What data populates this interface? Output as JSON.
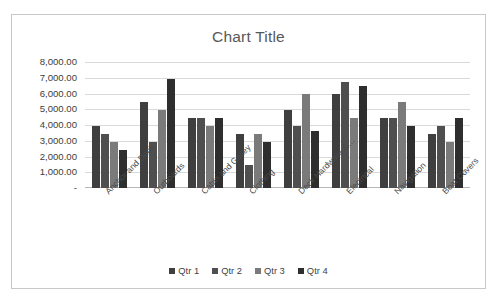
{
  "chart_data": {
    "type": "bar",
    "title": "Chart Title",
    "xlabel": "",
    "ylabel": "",
    "ylim": [
      0,
      8000
    ],
    "grid": true,
    "legend_position": "bottom",
    "y_ticks": [
      "-",
      "1,000.00",
      "2,000.00",
      "3,000.00",
      "4,000.00",
      "5,000.00",
      "6,000.00",
      "7,000.00",
      "8,000.00"
    ],
    "y_tick_values": [
      0,
      1000,
      2000,
      3000,
      4000,
      5000,
      6000,
      7000,
      8000
    ],
    "categories": [
      "Anchor and Dock",
      "Outboards",
      "Cabin and Galley",
      "Clothing",
      "Deck Hardware &…",
      "Electrical",
      "Navigation",
      "Boat Covers"
    ],
    "series": [
      {
        "name": "Qtr 1",
        "color": "#3f3f3f",
        "values": [
          3950,
          5450,
          4450,
          3450,
          4950,
          5950,
          4450,
          3450
        ]
      },
      {
        "name": "Qtr 2",
        "color": "#4f4f4f",
        "values": [
          3450,
          2950,
          4450,
          1450,
          3950,
          6750,
          4450,
          3950
        ]
      },
      {
        "name": "Qtr 3",
        "color": "#7a7a7a",
        "values": [
          2950,
          4950,
          3950,
          3450,
          5950,
          4450,
          5450,
          2950
        ]
      },
      {
        "name": "Qtr 4",
        "color": "#2e2e2e",
        "values": [
          2400,
          6950,
          4450,
          2950,
          3650,
          6450,
          3950,
          4450
        ]
      }
    ]
  },
  "legend": {
    "items": [
      "Qtr 1",
      "Qtr 2",
      "Qtr 3",
      "Qtr 4"
    ]
  }
}
